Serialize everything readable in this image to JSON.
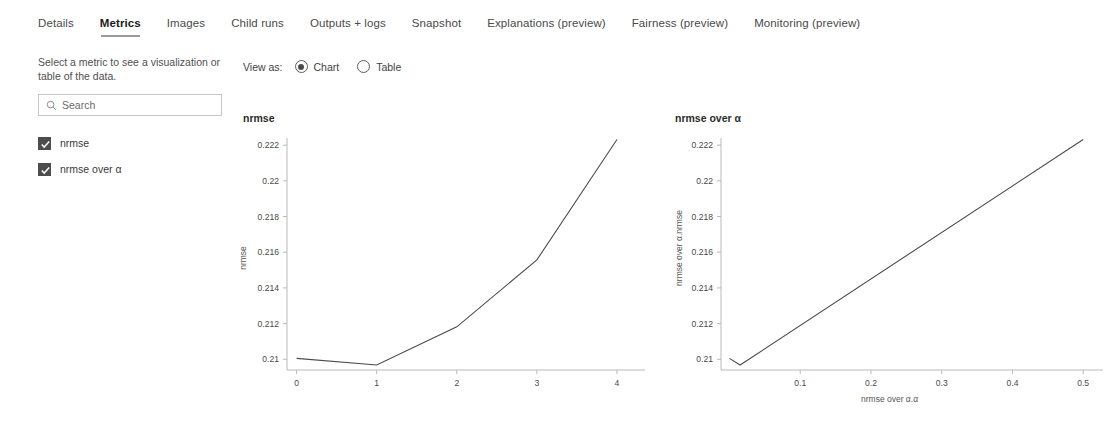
{
  "tabs": [
    {
      "label": "Details",
      "active": false
    },
    {
      "label": "Metrics",
      "active": true
    },
    {
      "label": "Images",
      "active": false
    },
    {
      "label": "Child runs",
      "active": false
    },
    {
      "label": "Outputs + logs",
      "active": false
    },
    {
      "label": "Snapshot",
      "active": false
    },
    {
      "label": "Explanations (preview)",
      "active": false
    },
    {
      "label": "Fairness (preview)",
      "active": false
    },
    {
      "label": "Monitoring (preview)",
      "active": false
    }
  ],
  "sidebar": {
    "help_text": "Select a metric to see a visualization or table of the data.",
    "search": {
      "placeholder": "Search",
      "value": "",
      "icon": "search-icon"
    },
    "metrics": [
      {
        "label": "nrmse",
        "checked": true
      },
      {
        "label": "nrmse over α",
        "checked": true
      }
    ]
  },
  "viewas": {
    "label": "View as:",
    "options": [
      {
        "label": "Chart",
        "selected": true
      },
      {
        "label": "Table",
        "selected": false
      }
    ]
  },
  "charts": {
    "left_title": "nrmse",
    "right_title": "nrmse over α"
  },
  "colors": {
    "line": "#4b4b4b",
    "axis": "#b9b9b9",
    "checkbox": "#4d4d4d",
    "text": "#323130"
  },
  "chart_data": [
    {
      "type": "line",
      "title": "nrmse",
      "xlabel": "",
      "ylabel": "nrmse",
      "x": [
        0,
        1,
        2,
        3,
        4
      ],
      "values": [
        0.21005,
        0.20968,
        0.21182,
        0.21557,
        0.22232
      ],
      "xticks": [
        "0",
        "1",
        "2",
        "3",
        "4"
      ],
      "yticks": [
        "0.21",
        "0.212",
        "0.214",
        "0.216",
        "0.218",
        "0.22",
        "0.222"
      ],
      "ytickvals": [
        0.21,
        0.212,
        0.214,
        0.216,
        0.218,
        0.22,
        0.222
      ],
      "xlim": [
        -0.12,
        4.35
      ],
      "ylim": [
        0.2094,
        0.2224
      ],
      "grid": false,
      "legend": "none"
    },
    {
      "type": "line",
      "title": "nrmse over α",
      "xlabel": "nrmse over α.α",
      "ylabel": "nrmse over α.nrmse",
      "x": [
        0.0,
        0.015,
        0.5
      ],
      "values": [
        0.21005,
        0.20968,
        0.22232
      ],
      "xticks": [
        "0.1",
        "0.2",
        "0.3",
        "0.4",
        "0.5"
      ],
      "xtickvals": [
        0.1,
        0.2,
        0.3,
        0.4,
        0.5
      ],
      "yticks": [
        "0.21",
        "0.212",
        "0.214",
        "0.216",
        "0.218",
        "0.22",
        "0.222"
      ],
      "ytickvals": [
        0.21,
        0.212,
        0.214,
        0.216,
        0.218,
        0.22,
        0.222
      ],
      "xlim": [
        -0.012,
        0.528
      ],
      "ylim": [
        0.2094,
        0.2224
      ],
      "grid": false,
      "legend": "none"
    }
  ]
}
